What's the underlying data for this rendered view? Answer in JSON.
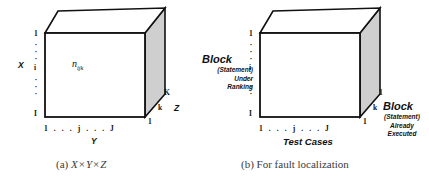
{
  "figure": {
    "panels": [
      {
        "id": "a",
        "caption_prefix": "(a)",
        "caption_math": "X × Y × Z",
        "caption_parts": {
          "x": "X",
          "times1": "×",
          "y": "Y",
          "times2": "×",
          "z": "Z"
        },
        "cube": {
          "front_face_color": "#ffffff",
          "top_face_color": "#ffffff",
          "side_face_color": "#cfcfcf",
          "edge_color": "#111111"
        },
        "front_label": "n",
        "front_label_sub": "ijk",
        "vertical_axis": {
          "name": "X",
          "top_tick": "1",
          "mid_tick": "i",
          "bottom_tick": "I",
          "dots": "·"
        },
        "horizontal_axis": {
          "name": "Y",
          "ticks": "1 . . . j . . . J"
        },
        "depth_axis": {
          "name": "Z",
          "near_tick": "1",
          "mid_tick": "k",
          "far_tick": "K"
        }
      },
      {
        "id": "b",
        "caption_prefix": "(b)",
        "caption_text": "For fault localization",
        "cube": {
          "front_face_color": "#ffffff",
          "top_face_color": "#ffffff",
          "side_face_color": "#cfcfcf",
          "edge_color": "#111111"
        },
        "vertical_axis": {
          "title": "Block",
          "subtitle_lines": [
            "(Statement)",
            "Under",
            "Ranking"
          ],
          "top_tick": "1",
          "mid_tick": "i",
          "bottom_tick": "I",
          "dots": "·"
        },
        "horizontal_axis": {
          "name": "Test Cases",
          "ticks": "1 . . . j . . . J"
        },
        "depth_axis": {
          "title": "Block",
          "subtitle_lines": [
            "(Statement)",
            "Already",
            "Executed"
          ],
          "near_tick": "1",
          "mid_tick": "k",
          "far_tick": "1"
        }
      }
    ]
  }
}
